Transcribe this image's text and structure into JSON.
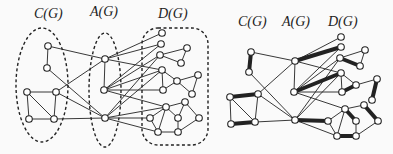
{
  "left_panel": {
    "labels": [
      {
        "text": "C(G)",
        "x": 34,
        "y": 6
      },
      {
        "text": "A(G)",
        "x": 90,
        "y": 4
      },
      {
        "text": "D(G)",
        "x": 158,
        "y": 6
      }
    ],
    "regions": [
      {
        "name": "C(G)",
        "shape": "ellipse",
        "cx": 42,
        "cy": 85,
        "rx": 26,
        "ry": 57
      },
      {
        "name": "A(G)",
        "shape": "ellipse",
        "cx": 105,
        "cy": 90,
        "rx": 16,
        "ry": 57
      },
      {
        "name": "D(G)",
        "shape": "roundrect",
        "x": 142,
        "y": 28,
        "w": 66,
        "h": 117,
        "r": 16
      }
    ],
    "nodes": [
      [
        48,
        46
      ],
      [
        47,
        68
      ],
      [
        27,
        92
      ],
      [
        56,
        92
      ],
      [
        29,
        119
      ],
      [
        54,
        119
      ],
      [
        105,
        59
      ],
      [
        104,
        90
      ],
      [
        105,
        118
      ],
      [
        162,
        33
      ],
      [
        161,
        44
      ],
      [
        160,
        55
      ],
      [
        187,
        48
      ],
      [
        181,
        63
      ],
      [
        162,
        70
      ],
      [
        163,
        90
      ],
      [
        177,
        81
      ],
      [
        198,
        75
      ],
      [
        192,
        94
      ],
      [
        166,
        107
      ],
      [
        185,
        102
      ],
      [
        150,
        118
      ],
      [
        178,
        118
      ],
      [
        199,
        118
      ],
      [
        158,
        132
      ],
      [
        178,
        132
      ]
    ],
    "edges": [
      [
        0,
        1
      ],
      [
        2,
        3
      ],
      [
        2,
        4
      ],
      [
        2,
        5
      ],
      [
        3,
        5
      ],
      [
        4,
        5
      ],
      [
        0,
        6
      ],
      [
        1,
        8
      ],
      [
        3,
        6
      ],
      [
        3,
        8
      ],
      [
        5,
        8
      ],
      [
        6,
        7
      ],
      [
        6,
        9
      ],
      [
        6,
        10
      ],
      [
        6,
        14
      ],
      [
        7,
        10
      ],
      [
        7,
        11
      ],
      [
        7,
        14
      ],
      [
        7,
        15
      ],
      [
        7,
        19
      ],
      [
        8,
        11
      ],
      [
        8,
        14
      ],
      [
        8,
        19
      ],
      [
        8,
        21
      ],
      [
        8,
        24
      ],
      [
        11,
        12
      ],
      [
        11,
        13
      ],
      [
        12,
        13
      ],
      [
        14,
        15
      ],
      [
        14,
        16
      ],
      [
        15,
        16
      ],
      [
        16,
        17
      ],
      [
        16,
        18
      ],
      [
        17,
        18
      ],
      [
        19,
        20
      ],
      [
        19,
        21
      ],
      [
        19,
        22
      ],
      [
        19,
        24
      ],
      [
        20,
        23
      ],
      [
        21,
        24
      ],
      [
        22,
        25
      ],
      [
        23,
        25
      ],
      [
        24,
        25
      ],
      [
        22,
        20
      ]
    ]
  },
  "right_panel": {
    "labels": [
      {
        "text": "C(G)",
        "x": 238,
        "y": 14
      },
      {
        "text": "A(G)",
        "x": 282,
        "y": 14
      },
      {
        "text": "D(G)",
        "x": 328,
        "y": 14
      }
    ],
    "nodes": [
      [
        251,
        52
      ],
      [
        249,
        72
      ],
      [
        230,
        97
      ],
      [
        258,
        94
      ],
      [
        231,
        124
      ],
      [
        255,
        122
      ],
      [
        295,
        61
      ],
      [
        294,
        92
      ],
      [
        295,
        120
      ],
      [
        341,
        37
      ],
      [
        341,
        47
      ],
      [
        340,
        58
      ],
      [
        365,
        50
      ],
      [
        360,
        66
      ],
      [
        341,
        73
      ],
      [
        342,
        92
      ],
      [
        356,
        85
      ],
      [
        377,
        79
      ],
      [
        372,
        100
      ],
      [
        345,
        109
      ],
      [
        364,
        105
      ],
      [
        328,
        121
      ],
      [
        356,
        121
      ],
      [
        378,
        121
      ],
      [
        337,
        136
      ],
      [
        356,
        136
      ]
    ],
    "edges": [
      [
        0,
        1,
        "bold"
      ],
      [
        2,
        3,
        "bold"
      ],
      [
        2,
        4
      ],
      [
        2,
        5
      ],
      [
        3,
        5
      ],
      [
        4,
        5,
        "bold"
      ],
      [
        0,
        6
      ],
      [
        1,
        8
      ],
      [
        3,
        6
      ],
      [
        3,
        8
      ],
      [
        5,
        8
      ],
      [
        6,
        7
      ],
      [
        6,
        9
      ],
      [
        6,
        10,
        "bold"
      ],
      [
        6,
        14
      ],
      [
        7,
        10
      ],
      [
        7,
        11
      ],
      [
        7,
        14,
        "bold"
      ],
      [
        7,
        15
      ],
      [
        7,
        19
      ],
      [
        8,
        11
      ],
      [
        8,
        14
      ],
      [
        8,
        21,
        "bold"
      ],
      [
        8,
        24
      ],
      [
        11,
        12
      ],
      [
        11,
        13,
        "bold"
      ],
      [
        12,
        13
      ],
      [
        14,
        15
      ],
      [
        14,
        16
      ],
      [
        15,
        16,
        "bold"
      ],
      [
        16,
        17
      ],
      [
        17,
        18,
        "bold"
      ],
      [
        19,
        20
      ],
      [
        19,
        21
      ],
      [
        19,
        22,
        "bold"
      ],
      [
        19,
        24
      ],
      [
        20,
        23,
        "bold"
      ],
      [
        21,
        24
      ],
      [
        22,
        25
      ],
      [
        23,
        25
      ],
      [
        24,
        25,
        "bold"
      ]
    ]
  },
  "style": {
    "stroke": "#222222",
    "node_fill": "#ffffff",
    "background": "#fafafa"
  }
}
